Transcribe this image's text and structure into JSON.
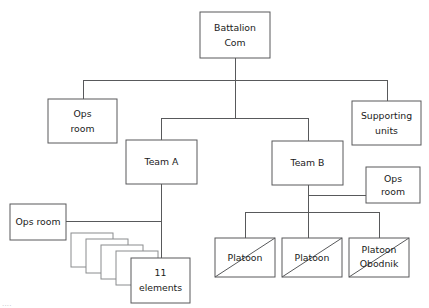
{
  "diagram": {
    "type": "org-chart",
    "colors": {
      "box_stroke": "#58595b",
      "stack_stroke": "#8a8c8e",
      "connector": "#58595b",
      "text": "#1a1a1a",
      "background": "#ffffff"
    },
    "nodes": {
      "battalion_com": {
        "line1": "Battalion",
        "line2": "Com"
      },
      "ops_room_left_top": {
        "line1": "Ops",
        "line2": "room"
      },
      "supporting_units": {
        "line1": "Supporting",
        "line2": "units"
      },
      "team_a": {
        "line1": "Team A"
      },
      "team_b": {
        "line1": "Team B"
      },
      "ops_room_right": {
        "line1": "Ops",
        "line2": "room"
      },
      "ops_room_left_bottom": {
        "line1": "Ops room"
      },
      "elements_stack": {
        "line1": "11",
        "line2": "elements"
      },
      "platoon_1": {
        "line1": "Platoon"
      },
      "platoon_2": {
        "line1": "Platoon"
      },
      "platoon_3": {
        "line1": "Platoon",
        "line2": "Obodnik"
      }
    },
    "caption": "...."
  }
}
